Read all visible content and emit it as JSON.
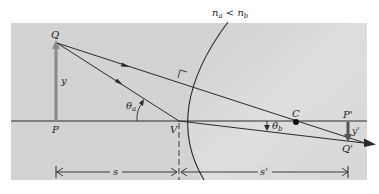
{
  "figure": {
    "title_label": "n_a < n_b",
    "title_parts": {
      "n": "n",
      "a_sub": "a",
      "lt": " < ",
      "b_sub": "b"
    },
    "colors": {
      "panel": "#d3d3d3",
      "panel_right": "#dcdcdc",
      "ink": "#2a2a2a",
      "object_arrow": "#8a8a8a"
    },
    "points": {
      "object_tip": "Q",
      "object_base": "P",
      "vertex": "V",
      "center": "C",
      "image_base": "P'",
      "image_tip": "Q'"
    },
    "heights": {
      "object": "y",
      "image": "y'"
    },
    "angles": {
      "incident": "θ",
      "incident_sub": "a",
      "refracted": "θ",
      "refracted_sub": "b"
    },
    "distances": {
      "object_distance": "s",
      "image_distance": "s'"
    }
  }
}
